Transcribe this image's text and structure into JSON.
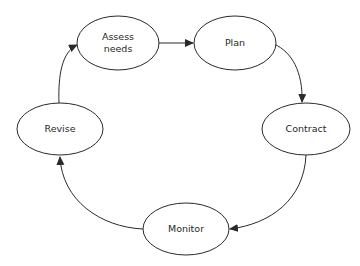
{
  "diagram": {
    "type": "cycle",
    "colors": {
      "background": "#ffffff",
      "stroke": "#2a2a2a",
      "text": "#262a26"
    },
    "nodes": [
      {
        "id": "assess",
        "label": "Assess\nneeds",
        "cx": 118,
        "cy": 43,
        "rx": 41,
        "ry": 27
      },
      {
        "id": "plan",
        "label": "Plan",
        "cx": 235,
        "cy": 43,
        "rx": 41,
        "ry": 27
      },
      {
        "id": "contract",
        "label": "Contract",
        "cx": 306,
        "cy": 129,
        "rx": 44,
        "ry": 26
      },
      {
        "id": "monitor",
        "label": "Monitor",
        "cx": 186,
        "cy": 229,
        "rx": 43,
        "ry": 26
      },
      {
        "id": "revise",
        "label": "Revise",
        "cx": 60,
        "cy": 129,
        "rx": 43,
        "ry": 26
      }
    ],
    "edges": [
      {
        "from": "assess",
        "to": "plan"
      },
      {
        "from": "plan",
        "to": "contract"
      },
      {
        "from": "contract",
        "to": "monitor"
      },
      {
        "from": "monitor",
        "to": "revise"
      },
      {
        "from": "revise",
        "to": "assess"
      }
    ]
  }
}
